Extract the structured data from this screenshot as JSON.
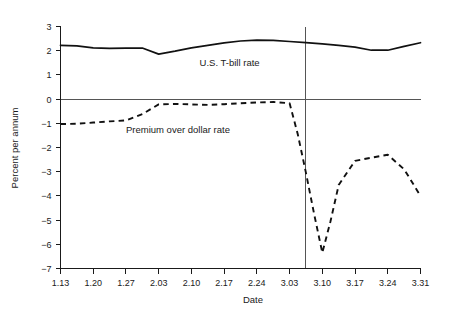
{
  "chart_data": {
    "type": "line",
    "title": "",
    "xlabel": "Date",
    "ylabel": "Percent per annum",
    "grid": false,
    "legend_position": "inline-annotation",
    "xlim": [
      0,
      11
    ],
    "ylim": [
      -7,
      3
    ],
    "yticks": [
      3,
      2,
      1,
      0,
      -1,
      -2,
      -3,
      -4,
      -5,
      -6,
      -7
    ],
    "ytick_labels": [
      "3",
      "2",
      "1",
      "0",
      "−1",
      "−2",
      "−3",
      "−4",
      "−5",
      "−6",
      "−7"
    ],
    "xticks": [
      0,
      1,
      2,
      3,
      4,
      5,
      6,
      7,
      8,
      9,
      10,
      11
    ],
    "categories": [
      "1.13",
      "1.20",
      "1.27",
      "2.03",
      "2.10",
      "2.17",
      "2.24",
      "3.03",
      "3.10",
      "3.17",
      "3.24",
      "3.31"
    ],
    "annotations": [
      {
        "name": "event-line",
        "type": "vline",
        "x": 7.5,
        "label": ""
      }
    ],
    "series": [
      {
        "name": "U.S. T-bill rate",
        "style": "solid",
        "label_x": 4.25,
        "label_y": 1.35,
        "x": [
          0,
          0.5,
          1,
          1.5,
          2,
          2.5,
          3,
          3.5,
          4,
          4.5,
          5,
          5.5,
          6,
          6.5,
          7,
          7.5,
          8,
          8.5,
          9,
          9.5,
          10,
          10.5,
          11
        ],
        "values": [
          2.22,
          2.2,
          2.12,
          2.1,
          2.11,
          2.11,
          1.86,
          1.98,
          2.12,
          2.22,
          2.32,
          2.4,
          2.44,
          2.43,
          2.38,
          2.33,
          2.28,
          2.22,
          2.15,
          2.02,
          2.02,
          2.18,
          2.33
        ]
      },
      {
        "name": "Premium over dollar rate",
        "style": "dashed",
        "label_x": 2.0,
        "label_y": -1.42,
        "x": [
          0,
          0.5,
          1,
          1.5,
          2,
          2.5,
          3,
          3.5,
          4,
          4.5,
          5,
          5.5,
          6,
          6.5,
          7,
          7.25,
          7.5,
          7.75,
          8,
          8.25,
          8.5,
          9,
          9.5,
          10,
          10.5,
          11
        ],
        "values": [
          -1.03,
          -1.02,
          -0.97,
          -0.92,
          -0.88,
          -0.62,
          -0.22,
          -0.2,
          -0.22,
          -0.24,
          -0.21,
          -0.17,
          -0.14,
          -0.12,
          -0.17,
          -1.45,
          -3.05,
          -4.75,
          -6.35,
          -5.05,
          -3.55,
          -2.55,
          -2.42,
          -2.3,
          -2.9,
          -4.0
        ]
      }
    ]
  },
  "colors": {
    "series_line": "#111111",
    "axis": "#1a1a1a",
    "reference_line": "#555555",
    "background": "#ffffff"
  }
}
